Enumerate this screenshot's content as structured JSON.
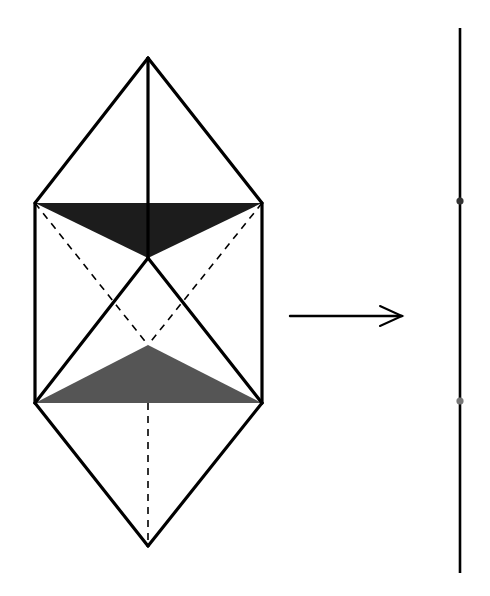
{
  "diagram": {
    "colors": {
      "background": "#ffffff",
      "stroke": "#000000",
      "upper_triangle_fill": "#1c1c1c",
      "lower_triangle_fill": "#555555",
      "upper_point": "#333333",
      "lower_point": "#777777"
    },
    "polyhedron": {
      "top_apex": [
        148,
        58
      ],
      "upper_left": [
        35,
        203
      ],
      "upper_right": [
        262,
        203
      ],
      "center": [
        148,
        258
      ],
      "lower_inner": [
        148,
        345
      ],
      "lower_left": [
        35,
        403
      ],
      "lower_right": [
        262,
        403
      ],
      "bottom_apex": [
        148,
        546
      ]
    },
    "arrow": {
      "from": [
        290,
        316
      ],
      "to": [
        402,
        316
      ]
    },
    "line": {
      "x": 460,
      "y_top": 28,
      "y_bottom": 573,
      "points": [
        201,
        401
      ]
    }
  }
}
